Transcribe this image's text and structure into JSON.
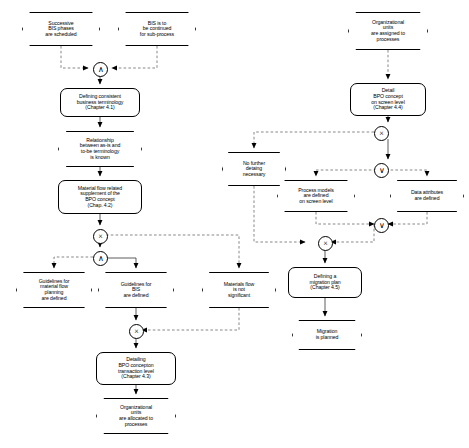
{
  "diagram": {
    "type": "event-driven-process-chain",
    "colors": {
      "line": "#000000",
      "node_fill": "#ffffff",
      "text": "#000000"
    },
    "legend": {
      "and": "∧",
      "or": "∨",
      "xor": "×"
    }
  },
  "nodes": [
    {
      "id": "ev_successive_phases",
      "kind": "event",
      "label": "Successive\nBIS phases\nare scheduled",
      "x": 22,
      "y": 12,
      "w": 78,
      "h": 34
    },
    {
      "id": "ev_bis_continued",
      "kind": "event",
      "label": "BIS is to\nbe continued\nfor sub-process",
      "x": 118,
      "y": 12,
      "w": 78,
      "h": 34
    },
    {
      "id": "ev_org_units_assigned",
      "kind": "event",
      "label": "Organizational\nunits\nare assigned to\nprocesses",
      "x": 348,
      "y": 12,
      "w": 80,
      "h": 38
    },
    {
      "id": "fn_defining_terminology",
      "kind": "function",
      "label": "Defining consistent\nbusiness terminology\n(Chapter 4.1)",
      "x": 60,
      "y": 88,
      "w": 80,
      "h": 29
    },
    {
      "id": "ev_relationship_known",
      "kind": "event",
      "label": "Relationship\nbetween as-is and\nto-be terminology\nis known",
      "x": 58,
      "y": 131,
      "w": 84,
      "h": 36
    },
    {
      "id": "fn_material_flow_supplement",
      "kind": "function",
      "label": "Material flow related\nsupplement of the\nBPO concept\n(Chap. 4.2)",
      "x": 58,
      "y": 180,
      "w": 84,
      "h": 34
    },
    {
      "id": "fn_detail_bpo_screen",
      "kind": "function",
      "label": "Detail\nBPO concept\non screen level\n(Chapter 4.4)",
      "x": 350,
      "y": 83,
      "w": 76,
      "h": 33
    },
    {
      "id": "ev_no_further_detailing",
      "kind": "event",
      "label": "No further\ndetaing\nnecessary",
      "x": 222,
      "y": 152,
      "w": 64,
      "h": 34
    },
    {
      "id": "ev_process_models_defined",
      "kind": "event",
      "label": "Process models\nare defined\non screen level",
      "x": 277,
      "y": 180,
      "w": 78,
      "h": 32
    },
    {
      "id": "ev_data_attributes_defined",
      "kind": "event",
      "label": "Data attributes\nare defined",
      "x": 390,
      "y": 180,
      "w": 74,
      "h": 32
    },
    {
      "id": "ev_guidelines_material_flow",
      "kind": "event",
      "label": "Guidelines for\nmaterial flow\nplanning\nare defined",
      "x": 16,
      "y": 272,
      "w": 76,
      "h": 36
    },
    {
      "id": "ev_guidelines_bis",
      "kind": "event",
      "label": "Guidelines for\nBIS\nare defined",
      "x": 98,
      "y": 272,
      "w": 76,
      "h": 36
    },
    {
      "id": "ev_materials_flow_not_significant",
      "kind": "event",
      "label": "Materials flow\nis not\nsignificant",
      "x": 202,
      "y": 272,
      "w": 74,
      "h": 36
    },
    {
      "id": "fn_defining_migration_plan",
      "kind": "function",
      "label": "Defining a\nmigration plan\n(Chapter 4.5)",
      "x": 288,
      "y": 267,
      "w": 74,
      "h": 31
    },
    {
      "id": "ev_migration_planned",
      "kind": "event",
      "label": "Migration\nis planned",
      "x": 292,
      "y": 320,
      "w": 70,
      "h": 30
    },
    {
      "id": "fn_detailing_bpo_transaction",
      "kind": "function",
      "label": "Detailing\nBPO concepton\ntransaction level\n(Chapter 4.3)",
      "x": 96,
      "y": 352,
      "w": 80,
      "h": 33
    },
    {
      "id": "ev_org_units_allocated",
      "kind": "event",
      "label": "Organizational\nunits\nare allocated to\nprocesses",
      "x": 96,
      "y": 398,
      "w": 80,
      "h": 36
    }
  ],
  "connectors": [
    {
      "id": "cn_and_top",
      "type": "and",
      "symbol": "∧",
      "x": 93,
      "y": 62
    },
    {
      "id": "cn_xor_left",
      "type": "xor",
      "symbol": "×",
      "x": 93,
      "y": 229
    },
    {
      "id": "cn_and_left",
      "type": "and",
      "symbol": "∧",
      "x": 93,
      "y": 251
    },
    {
      "id": "cn_xor_bis",
      "type": "xor",
      "symbol": "×",
      "x": 129,
      "y": 324
    },
    {
      "id": "cn_xor_right",
      "type": "xor",
      "symbol": "×",
      "x": 381,
      "y": 126
    },
    {
      "id": "cn_or_right_top",
      "type": "or",
      "symbol": "∨",
      "x": 381,
      "y": 163
    },
    {
      "id": "cn_or_right_bottom",
      "type": "or",
      "symbol": "∨",
      "x": 381,
      "y": 218
    },
    {
      "id": "cn_xor_migration",
      "type": "xor",
      "symbol": "×",
      "x": 318,
      "y": 236
    }
  ],
  "edges": [
    {
      "id": "e1",
      "from": "ev_successive_phases",
      "to": "cn_and_top",
      "style": "dashed"
    },
    {
      "id": "e2",
      "from": "ev_bis_continued",
      "to": "cn_and_top",
      "style": "dashed"
    },
    {
      "id": "e3",
      "from": "cn_and_top",
      "to": "fn_defining_terminology",
      "style": "solid"
    },
    {
      "id": "e4",
      "from": "fn_defining_terminology",
      "to": "ev_relationship_known",
      "style": "solid"
    },
    {
      "id": "e5",
      "from": "ev_relationship_known",
      "to": "fn_material_flow_supplement",
      "style": "solid"
    },
    {
      "id": "e6",
      "from": "fn_material_flow_supplement",
      "to": "cn_xor_left",
      "style": "solid"
    },
    {
      "id": "e7",
      "from": "cn_xor_left",
      "to": "cn_and_left",
      "style": "solid"
    },
    {
      "id": "e8",
      "from": "cn_and_left",
      "to": "ev_guidelines_material_flow",
      "style": "dashed"
    },
    {
      "id": "e9",
      "from": "cn_and_left",
      "to": "ev_guidelines_bis",
      "style": "solid"
    },
    {
      "id": "e10",
      "from": "ev_guidelines_bis",
      "to": "cn_xor_bis",
      "style": "solid"
    },
    {
      "id": "e11",
      "from": "cn_xor_bis",
      "to": "fn_detailing_bpo_transaction",
      "style": "solid"
    },
    {
      "id": "e12",
      "from": "fn_detailing_bpo_transaction",
      "to": "ev_org_units_allocated",
      "style": "solid"
    },
    {
      "id": "e13",
      "from": "ev_org_units_assigned",
      "to": "fn_detail_bpo_screen",
      "style": "dashed"
    },
    {
      "id": "e14",
      "from": "fn_detail_bpo_screen",
      "to": "cn_xor_right",
      "style": "solid"
    },
    {
      "id": "e15",
      "from": "cn_xor_right",
      "to": "cn_or_right_top",
      "style": "solid"
    },
    {
      "id": "e16",
      "from": "cn_or_right_top",
      "to": "ev_process_models_defined",
      "style": "dashed"
    },
    {
      "id": "e17",
      "from": "cn_or_right_top",
      "to": "ev_data_attributes_defined",
      "style": "dashed"
    },
    {
      "id": "e18",
      "from": "ev_process_models_defined",
      "to": "cn_or_right_bottom",
      "style": "dashed"
    },
    {
      "id": "e19",
      "from": "ev_data_attributes_defined",
      "to": "cn_or_right_bottom",
      "style": "dashed"
    },
    {
      "id": "e20",
      "from": "cn_xor_right",
      "to": "ev_no_further_detailing",
      "style": "dashed"
    },
    {
      "id": "e21",
      "from": "cn_or_right_bottom",
      "to": "cn_xor_migration",
      "style": "dashed"
    },
    {
      "id": "e22",
      "from": "ev_no_further_detailing",
      "to": "cn_xor_migration",
      "style": "dashed"
    },
    {
      "id": "e23",
      "from": "cn_xor_migration",
      "to": "fn_defining_migration_plan",
      "style": "solid"
    },
    {
      "id": "e24",
      "from": "fn_defining_migration_plan",
      "to": "ev_migration_planned",
      "style": "solid"
    },
    {
      "id": "e25",
      "from": "cn_xor_left",
      "to": "ev_materials_flow_not_significant",
      "style": "dashed"
    },
    {
      "id": "e26",
      "from": "ev_materials_flow_not_significant",
      "to": "cn_xor_bis",
      "style": "dashed"
    }
  ]
}
